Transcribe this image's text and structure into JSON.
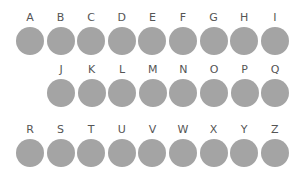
{
  "colors": {
    "circle": "#a4a4a4",
    "label": "#555555"
  },
  "rows": [
    {
      "letters": [
        "A",
        "B",
        "C",
        "D",
        "E",
        "F",
        "G",
        "H",
        "I"
      ]
    },
    {
      "letters": [
        "J",
        "K",
        "L",
        "M",
        "N",
        "O",
        "P",
        "Q"
      ]
    },
    {
      "letters": [
        "R",
        "S",
        "T",
        "U",
        "V",
        "W",
        "X",
        "Y",
        "Z"
      ]
    }
  ]
}
